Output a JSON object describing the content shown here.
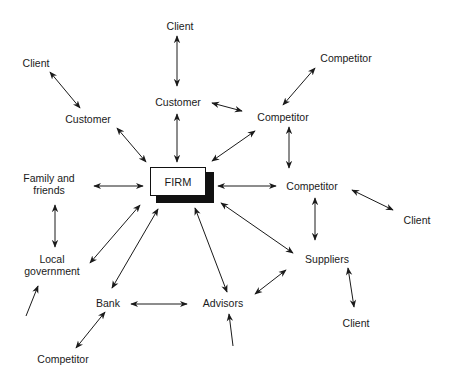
{
  "center": {
    "label": "FIRM"
  },
  "nodes": {
    "client_top": "Client",
    "client_left": "Client",
    "customer_left": "Customer",
    "customer_top": "Customer",
    "competitor_far_right_top": "Competitor",
    "competitor_upper": "Competitor",
    "competitor_right": "Competitor",
    "client_right": "Client",
    "family_line1": "Family and",
    "family_line2": "friends",
    "local_line1": "Local",
    "local_line2": "government",
    "bank": "Bank",
    "advisors": "Advisors",
    "suppliers": "Suppliers",
    "client_bottom_right": "Client",
    "competitor_bottom_left": "Competitor"
  },
  "colors": {
    "line": "#1a1a1a",
    "background": "#ffffff"
  }
}
